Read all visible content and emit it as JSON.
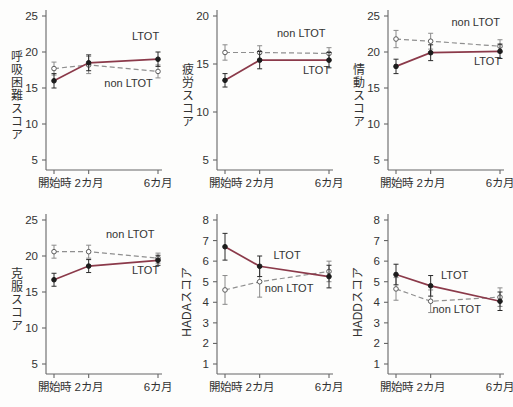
{
  "figure": {
    "background": "#fdfdfc",
    "x_axis_labels": [
      "開始時",
      "2カ月",
      "6カ月"
    ],
    "x_values": [
      0,
      2,
      6
    ],
    "legend_series": [
      "LTOT",
      "non LTOT"
    ],
    "colors": {
      "ltot_line": "#8b3a4a",
      "ltot_marker": "#1c1c1c",
      "nonltot_line": "#8f8f8f",
      "nonltot_marker_stroke": "#5a5a5a",
      "axis": "#666666",
      "text": "#333333"
    }
  },
  "chart_data": [
    {
      "type": "line",
      "ylabel": "呼吸困難スコア",
      "ylabel_style": "upright",
      "ylim": [
        5,
        25
      ],
      "yticks": [
        25,
        20,
        15,
        10,
        5
      ],
      "categories": [
        "開始時",
        "2カ月",
        "6カ月"
      ],
      "x": [
        0,
        2,
        6
      ],
      "series": [
        {
          "name": "LTOT",
          "line": "solid",
          "marker": "filled",
          "values": [
            16.0,
            18.5,
            19.0
          ],
          "errors": [
            1.0,
            1.1,
            1.0
          ],
          "label": {
            "x": 4.5,
            "y": 21.6
          }
        },
        {
          "name": "non LTOT",
          "line": "dashed",
          "marker": "open",
          "values": [
            17.7,
            18.2,
            17.3
          ],
          "errors": [
            0.9,
            1.2,
            0.9
          ],
          "label": {
            "x": 2.9,
            "y": 15.2
          }
        }
      ]
    },
    {
      "type": "line",
      "ylabel": "疲労スコア",
      "ylabel_style": "upright",
      "ylim": [
        5,
        20
      ],
      "yticks": [
        20,
        15,
        10,
        5
      ],
      "categories": [
        "開始時",
        "2カ月",
        "6カ月"
      ],
      "x": [
        0,
        2,
        6
      ],
      "series": [
        {
          "name": "LTOT",
          "line": "solid",
          "marker": "filled",
          "values": [
            13.3,
            15.4,
            15.4
          ],
          "errors": [
            0.7,
            0.9,
            0.8
          ],
          "label": {
            "x": 4.5,
            "y": 14.0
          }
        },
        {
          "name": "non LTOT",
          "line": "dashed",
          "marker": "open",
          "values": [
            16.2,
            16.2,
            16.1
          ],
          "errors": [
            0.8,
            0.7,
            0.6
          ],
          "label": {
            "x": 3.0,
            "y": 17.8
          }
        }
      ]
    },
    {
      "type": "line",
      "ylabel": "情動スコア",
      "ylabel_style": "upright",
      "ylim": [
        5,
        25
      ],
      "yticks": [
        25,
        20,
        15,
        10,
        5
      ],
      "categories": [
        "開始時",
        "2カ月",
        "6カ月"
      ],
      "x": [
        0,
        2,
        6
      ],
      "series": [
        {
          "name": "LTOT",
          "line": "solid",
          "marker": "filled",
          "values": [
            18.0,
            19.9,
            20.1
          ],
          "errors": [
            1.0,
            1.1,
            1.0
          ],
          "label": {
            "x": 4.5,
            "y": 18.2
          }
        },
        {
          "name": "non LTOT",
          "line": "dashed",
          "marker": "open",
          "values": [
            21.8,
            21.5,
            20.8
          ],
          "errors": [
            1.2,
            1.1,
            0.9
          ],
          "label": {
            "x": 3.2,
            "y": 23.6
          }
        }
      ]
    },
    {
      "type": "line",
      "ylabel": "克服スコア",
      "ylabel_style": "upright",
      "ylim": [
        5,
        25
      ],
      "yticks": [
        25,
        20,
        15,
        10,
        5
      ],
      "categories": [
        "開始時",
        "2カ月",
        "6カ月"
      ],
      "x": [
        0,
        2,
        6
      ],
      "series": [
        {
          "name": "LTOT",
          "line": "solid",
          "marker": "filled",
          "values": [
            16.7,
            18.6,
            19.4
          ],
          "errors": [
            0.9,
            0.9,
            0.7
          ],
          "label": {
            "x": 4.5,
            "y": 17.5
          }
        },
        {
          "name": "non LTOT",
          "line": "dashed",
          "marker": "open",
          "values": [
            20.6,
            20.6,
            19.7
          ],
          "errors": [
            0.9,
            0.9,
            0.7
          ],
          "label": {
            "x": 3.0,
            "y": 22.5
          }
        }
      ]
    },
    {
      "type": "line",
      "ylabel": "HADAスコア",
      "ylabel_style": "rotated",
      "ylim": [
        1,
        8
      ],
      "yticks": [
        8,
        7,
        6,
        5,
        4,
        3,
        2,
        1
      ],
      "categories": [
        "開始時",
        "2カ月",
        "6カ月"
      ],
      "x": [
        0,
        2,
        6
      ],
      "series": [
        {
          "name": "LTOT",
          "line": "solid",
          "marker": "filled",
          "values": [
            6.7,
            5.75,
            5.25
          ],
          "errors": [
            0.65,
            0.5,
            0.55
          ],
          "label": {
            "x": 2.8,
            "y": 6.1
          }
        },
        {
          "name": "non LTOT",
          "line": "dashed",
          "marker": "open",
          "values": [
            4.6,
            5.0,
            5.5
          ],
          "errors": [
            0.7,
            0.75,
            0.5
          ],
          "label": {
            "x": 2.3,
            "y": 4.5
          }
        }
      ]
    },
    {
      "type": "line",
      "ylabel": "HADDスコア",
      "ylabel_style": "rotated",
      "ylim": [
        1,
        8
      ],
      "yticks": [
        8,
        7,
        6,
        5,
        4,
        3,
        2,
        1
      ],
      "categories": [
        "開始時",
        "2カ月",
        "6カ月"
      ],
      "x": [
        0,
        2,
        6
      ],
      "series": [
        {
          "name": "LTOT",
          "line": "solid",
          "marker": "filled",
          "values": [
            5.35,
            4.8,
            4.05
          ],
          "errors": [
            0.5,
            0.5,
            0.45
          ],
          "label": {
            "x": 2.6,
            "y": 5.15
          }
        },
        {
          "name": "non LTOT",
          "line": "dashed",
          "marker": "open",
          "values": [
            4.65,
            4.05,
            4.25
          ],
          "errors": [
            0.55,
            0.55,
            0.45
          ],
          "label": {
            "x": 2.1,
            "y": 3.5
          }
        }
      ]
    }
  ]
}
